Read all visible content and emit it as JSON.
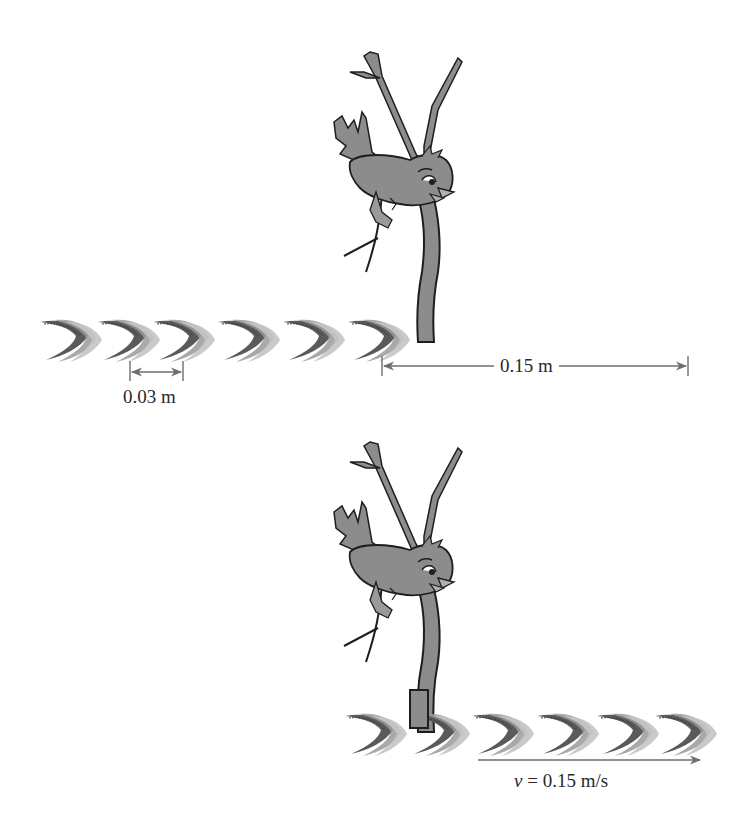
{
  "figure": {
    "colors": {
      "background": "#ffffff",
      "bird_fill": "#8c8c8c",
      "outline": "#1e1e1e",
      "crest_dark": "#5a5a5a",
      "crest_light": "#b4b4b4",
      "arrow": "#6e6e6e",
      "text": "#2a2a2a"
    }
  },
  "panel_top": {
    "crest_count": 6,
    "crest_x": [
      40,
      98,
      153,
      218,
      283,
      348
    ],
    "crest_y": 320,
    "wavelength_label": "0.03 m",
    "distance_label": "0.15 m"
  },
  "panel_bottom": {
    "crest_count": 6,
    "crest_x": [
      345,
      408,
      472,
      537,
      597,
      655
    ],
    "crest_y": 712,
    "velocity_symbol": "v",
    "velocity_value": "= 0.15 m/s"
  }
}
